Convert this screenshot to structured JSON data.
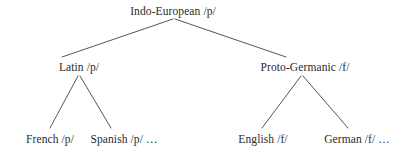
{
  "diagram": {
    "stroke_color": "#555555",
    "text_color": "#2b2b2b",
    "background_color": "#ffffff",
    "nodes": [
      {
        "id": "root",
        "label": "Indo-European /p/",
        "language": "Indo-European",
        "phoneme": "/p/",
        "level": 0
      },
      {
        "id": "latin",
        "label": "Latin /p/",
        "language": "Latin",
        "phoneme": "/p/",
        "level": 1
      },
      {
        "id": "pgmc",
        "label": "Proto-Germanic /f/",
        "language": "Proto-Germanic",
        "phoneme": "/f/",
        "level": 1
      },
      {
        "id": "french",
        "label": "French /p/",
        "language": "French",
        "phoneme": "/p/",
        "level": 2
      },
      {
        "id": "spanish",
        "label": "Spanish /p/ …",
        "language": "Spanish",
        "phoneme": "/p/",
        "level": 2
      },
      {
        "id": "english",
        "label": "English /f/",
        "language": "English",
        "phoneme": "/f/",
        "level": 2
      },
      {
        "id": "german",
        "label": "German /f/ …",
        "language": "German",
        "phoneme": "/f/",
        "level": 2
      }
    ],
    "edges": [
      {
        "from": "root",
        "to": "latin",
        "x1": 173,
        "y1": 19,
        "x2": 62,
        "y2": 57
      },
      {
        "from": "root",
        "to": "pgmc",
        "x1": 175,
        "y1": 19,
        "x2": 286,
        "y2": 57
      },
      {
        "from": "latin",
        "to": "french",
        "x1": 78,
        "y1": 76,
        "x2": 50,
        "y2": 128
      },
      {
        "from": "latin",
        "to": "spanish",
        "x1": 80,
        "y1": 76,
        "x2": 111,
        "y2": 128
      },
      {
        "from": "pgmc",
        "to": "english",
        "x1": 301,
        "y1": 76,
        "x2": 262,
        "y2": 128
      },
      {
        "from": "pgmc",
        "to": "german",
        "x1": 303,
        "y1": 76,
        "x2": 348,
        "y2": 128
      }
    ]
  }
}
